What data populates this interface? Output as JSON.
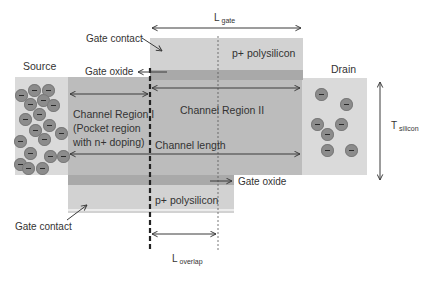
{
  "diagram": {
    "type": "device-cross-section",
    "colors": {
      "source_drain": "#dadada",
      "channel": "#bcbcbc",
      "gate_poly": "#d2d2d2",
      "gate_oxide": "#a9a9a9",
      "electron": "#8c8c8c",
      "arrow": "#3a3a3a"
    },
    "labels": {
      "source": "Source",
      "drain": "Drain",
      "gate_contact_top": "Gate contact",
      "gate_contact_bottom": "Gate contact",
      "gate_oxide_top": "Gate oxide",
      "gate_oxide_bottom": "Gate oxide",
      "poly_top": "p+ polysilicon",
      "poly_bottom": "p+ polysilicon",
      "channel_region_1_line1": "Channel Region I",
      "channel_region_1_line2": "(Pocket region",
      "channel_region_1_line3": "with n+ doping)",
      "channel_region_2": "Channel Region II",
      "channel_length": "Channel length",
      "l_gate_main": "L",
      "l_gate_sub": "gate",
      "t_silicon_main": "T",
      "t_silicon_sub": "silicon",
      "l_overlap_main": "L",
      "l_overlap_sub": "overlap"
    },
    "electrons": {
      "source_count": 19,
      "drain_count": 7
    }
  }
}
